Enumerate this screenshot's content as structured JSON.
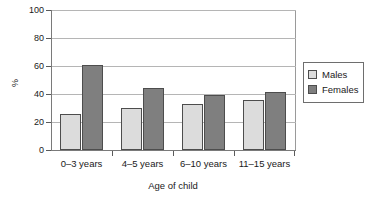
{
  "chart_data": {
    "type": "bar",
    "title": "",
    "subtitle": "",
    "xlabel": "Age of child",
    "ylabel": "%",
    "categories": [
      "0–3 years",
      "4–5 years",
      "6–10 years",
      "11–15 years"
    ],
    "series": [
      {
        "name": "Males",
        "color": "#dcdcdc",
        "values": [
          26,
          30,
          33,
          35.5
        ]
      },
      {
        "name": "Females",
        "color": "#7f7f7f",
        "values": [
          61,
          44,
          39.5,
          41.5
        ]
      }
    ],
    "ylim": [
      0,
      100
    ],
    "yticks": [
      0,
      20,
      40,
      60,
      80,
      100
    ],
    "ytick_labels": [
      "0",
      "20",
      "40",
      "60",
      "80",
      "100"
    ],
    "grid": "horizontal",
    "legend_position": "right",
    "legend_entries": [
      "Males",
      "Females"
    ]
  },
  "legend": {
    "items": [
      {
        "label": "Males"
      },
      {
        "label": "Females"
      }
    ]
  }
}
